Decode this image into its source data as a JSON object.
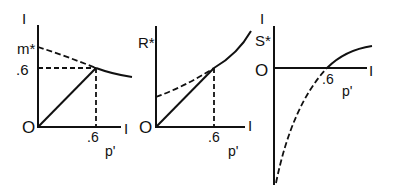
{
  "figure": {
    "panels": [
      {
        "id": "m",
        "axis_top_label": "I",
        "y_label": "m*",
        "y_tick_label": ".6",
        "origin_label": "O",
        "x_end_label": "I",
        "x_tick_label": ".6",
        "x_label": "p'"
      },
      {
        "id": "R",
        "y_label": "R*",
        "origin_label": "O",
        "x_end_label": "I",
        "x_tick_label": ".6",
        "x_label": "p'"
      },
      {
        "id": "S",
        "axis_top_label": "I",
        "y_label": "S*",
        "origin_label": "O",
        "x_end_label": "I",
        "x_tick_label": ".6",
        "x_label": "p'"
      }
    ],
    "colors": {
      "ink": "#111111",
      "background": "#ffffff"
    }
  }
}
